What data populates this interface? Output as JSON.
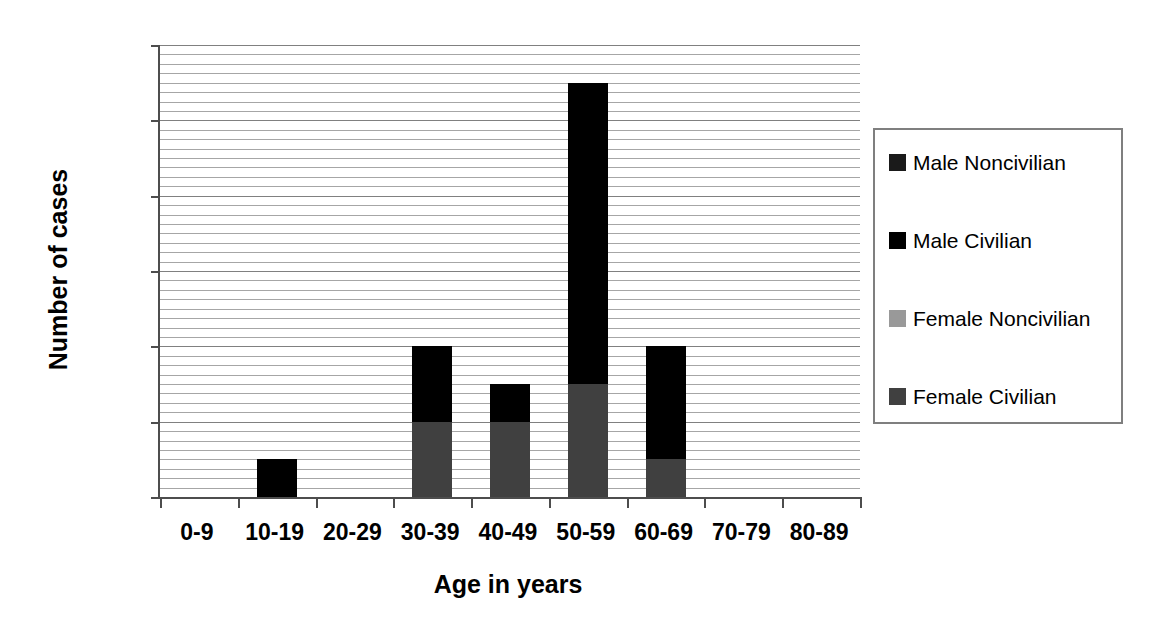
{
  "chart_data": {
    "type": "bar",
    "subtype": "stacked-bar",
    "title": "",
    "xlabel": "Age in years",
    "ylabel": "Number of cases",
    "categories": [
      "0-9",
      "10-19",
      "20-29",
      "30-39",
      "40-49",
      "50-59",
      "60-69",
      "70-79",
      "80-89"
    ],
    "series": [
      {
        "name": "Female Civilian",
        "color": "#404040",
        "values": [
          0,
          0,
          0,
          2,
          2,
          3,
          1,
          0,
          0
        ]
      },
      {
        "name": "Female Noncivilian",
        "color": "#999999",
        "values": [
          0,
          0,
          0,
          0,
          0,
          0,
          0,
          0,
          0
        ]
      },
      {
        "name": "Male Civilian",
        "color": "#000000",
        "values": [
          0,
          1,
          0,
          2,
          1,
          8,
          3,
          0,
          0
        ]
      },
      {
        "name": "Male Noncivilian",
        "color": "#1a1a1a",
        "values": [
          0,
          0,
          0,
          0,
          0,
          0,
          0,
          0,
          0
        ]
      }
    ],
    "totals": [
      0,
      1,
      0,
      4,
      3,
      11,
      4,
      0,
      0
    ],
    "ylim": [
      0,
      12
    ],
    "ytick_labels": [
      "0",
      "2",
      "4",
      "6",
      "8",
      "10",
      "12"
    ],
    "ytick_values": [
      0,
      2,
      4,
      6,
      8,
      10,
      12
    ],
    "y_major_interval": 2,
    "y_minor_interval": 0.25,
    "grid": "horizontal",
    "legend_position": "right",
    "legend_order": [
      "Male Noncivilian",
      "Male Civilian",
      "Female Noncivilian",
      "Female Civilian"
    ]
  },
  "axes": {
    "y_title": "Number of cases",
    "x_title": "Age in years",
    "axis_color": "#4d4d4d",
    "gridline_color": "#a6a6a6"
  },
  "legend": {
    "border_color": "#7f7f7f",
    "items": [
      {
        "label": "Male Noncivilian",
        "color": "#1a1a1a"
      },
      {
        "label": "Male Civilian",
        "color": "#000000"
      },
      {
        "label": "Female Noncivilian",
        "color": "#999999"
      },
      {
        "label": "Female Civilian",
        "color": "#404040"
      }
    ]
  }
}
